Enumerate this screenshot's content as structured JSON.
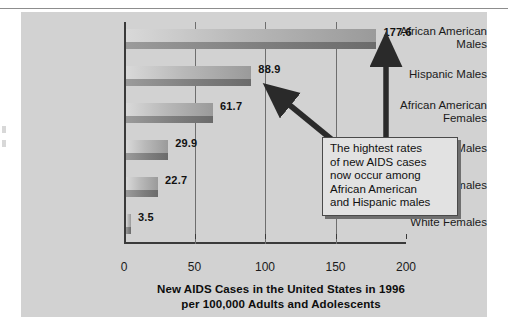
{
  "chart_data": {
    "type": "bar",
    "orientation": "horizontal",
    "title": "New AIDS Cases in the United States in 1996 per 100,000 Adults and Adolescents",
    "title_line1": "New AIDS Cases in the United States in 1996",
    "title_line2": "per 100,000 Adults and Adolescents",
    "xlabel": "",
    "ylabel": "",
    "xlim": [
      0,
      200
    ],
    "xticks": [
      0,
      50,
      100,
      150,
      200
    ],
    "xtick_labels": [
      "0",
      "50",
      "100",
      "150",
      "200"
    ],
    "grid": "vertical",
    "legend": "none",
    "categories": [
      "African American Males",
      "Hispanic Males",
      "African American Females",
      "White Males",
      "Hispanic Females",
      "White Females"
    ],
    "category_lines": [
      [
        "African American",
        "Males"
      ],
      [
        "Hispanic Males"
      ],
      [
        "African American",
        "Females"
      ],
      [
        "White Males"
      ],
      [
        "Hispanic Females"
      ],
      [
        "White Females"
      ]
    ],
    "values": [
      177.6,
      88.9,
      61.7,
      29.9,
      22.7,
      3.5
    ],
    "value_labels": [
      "177.6",
      "88.9",
      "61.7",
      "29.9",
      "22.7",
      "3.5"
    ],
    "annotations": [
      {
        "text": "The hightest rates of new AIDS cases now occur among African American and Hispanic males",
        "lines": [
          "The hightest rates",
          "of new AIDS cases",
          "now occur among",
          "African American",
          "and Hispanic males"
        ],
        "points_to": [
          "African American Males",
          "Hispanic Males"
        ]
      }
    ],
    "colors": {
      "panel_background": "#d2d2d2",
      "bar_light": "#d9d9d9",
      "bar_dark": "#9a9a9a",
      "bar_shadow": "#7e7e7e",
      "axis": "#3a3a3a",
      "gridline": "#6e6e6e",
      "callout_background": "#e2e2e2",
      "callout_border": "#4a4a4a",
      "arrow": "#2a2a2a",
      "text": "#111111"
    }
  }
}
